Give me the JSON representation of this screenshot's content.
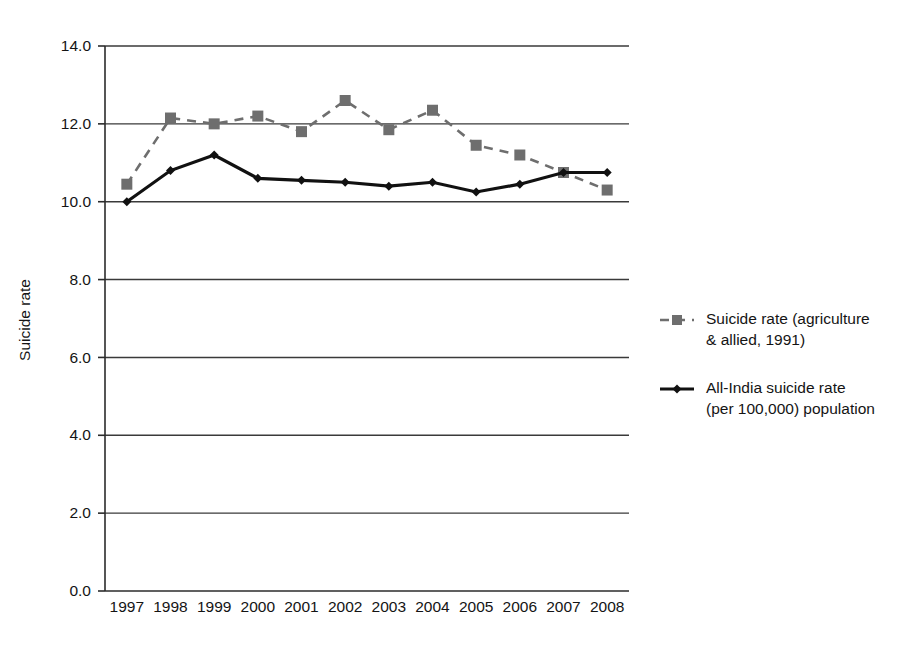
{
  "chart_data": {
    "type": "line",
    "title": "",
    "xlabel": "",
    "ylabel": "Suicide rate",
    "categories": [
      "1997",
      "1998",
      "1999",
      "2000",
      "2001",
      "2002",
      "2003",
      "2004",
      "2005",
      "2006",
      "2007",
      "2008"
    ],
    "x": [
      1997,
      1998,
      1999,
      2000,
      2001,
      2002,
      2003,
      2004,
      2005,
      2006,
      2007,
      2008
    ],
    "ylim": [
      0.0,
      14.0
    ],
    "ytick_values": [
      0.0,
      2.0,
      4.0,
      6.0,
      8.0,
      10.0,
      12.0,
      14.0
    ],
    "ytick_labels": [
      "0.0",
      "2.0",
      "4.0",
      "6.0",
      "8.0",
      "10.0",
      "12.0",
      "14.0"
    ],
    "grid": "horizontal",
    "legend_position": "right",
    "series": [
      {
        "name": "Suicide rate (agriculture & allied, 1991)",
        "legend_label_line1": "Suicide rate (agriculture",
        "legend_label_line2": "& allied, 1991)",
        "color": "#6e6e6e",
        "linestyle": "dashed",
        "marker": "square",
        "values": [
          10.45,
          12.15,
          12.0,
          12.2,
          11.8,
          12.6,
          11.85,
          12.35,
          11.45,
          11.2,
          10.75,
          10.3
        ]
      },
      {
        "name": "All-India suicide rate (per 100,000) population",
        "legend_label_line1": "All-India suicide rate",
        "legend_label_line2": "(per 100,000) population",
        "color": "#111111",
        "linestyle": "solid",
        "marker": "diamond",
        "values": [
          10.0,
          10.8,
          11.2,
          10.6,
          10.55,
          10.5,
          10.4,
          10.5,
          10.25,
          10.45,
          10.75,
          10.75
        ]
      }
    ]
  },
  "axis": {
    "y_title": "Suicide rate"
  }
}
